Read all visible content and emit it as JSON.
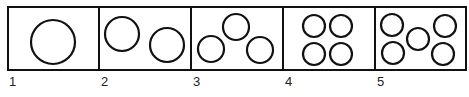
{
  "panels": [
    {
      "label": "1",
      "circles": [
        {
          "cx": 53,
          "cy": 42,
          "r": 22
        }
      ]
    },
    {
      "label": "2",
      "circles": [
        {
          "cx": 122,
          "cy": 34,
          "r": 17
        },
        {
          "cx": 167,
          "cy": 45,
          "r": 17
        }
      ]
    },
    {
      "label": "3",
      "circles": [
        {
          "cx": 211,
          "cy": 49,
          "r": 13
        },
        {
          "cx": 236,
          "cy": 27,
          "r": 13
        },
        {
          "cx": 260,
          "cy": 50,
          "r": 13
        }
      ]
    },
    {
      "label": "4",
      "circles": [
        {
          "cx": 314,
          "cy": 26,
          "r": 11
        },
        {
          "cx": 341,
          "cy": 26,
          "r": 11
        },
        {
          "cx": 314,
          "cy": 54,
          "r": 11
        },
        {
          "cx": 341,
          "cy": 54,
          "r": 11
        }
      ]
    },
    {
      "label": "5",
      "circles": [
        {
          "cx": 392,
          "cy": 25,
          "r": 11
        },
        {
          "cx": 393,
          "cy": 53,
          "r": 11
        },
        {
          "cx": 418,
          "cy": 39,
          "r": 11
        },
        {
          "cx": 445,
          "cy": 26,
          "r": 11
        },
        {
          "cx": 443,
          "cy": 54,
          "r": 11
        }
      ]
    }
  ],
  "stroke_color": "#111111"
}
